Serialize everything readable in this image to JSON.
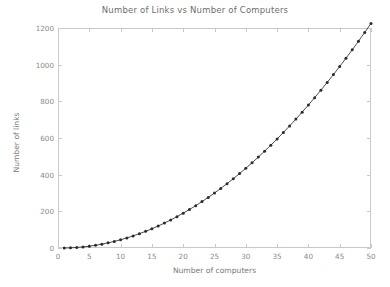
{
  "chart_data": {
    "type": "line",
    "title": "Number of Links vs Number of Computers",
    "xlabel": "Number of computers",
    "ylabel": "Number of links",
    "xlim": [
      0,
      50
    ],
    "ylim": [
      0,
      1200
    ],
    "xticks": [
      0,
      5,
      10,
      15,
      20,
      25,
      30,
      35,
      40,
      45,
      50
    ],
    "yticks": [
      0,
      200,
      400,
      600,
      800,
      1000,
      1200
    ],
    "grid": false,
    "legend": null,
    "marker": "filled-circle",
    "line_color": "#3a3a3a",
    "marker_color": "#2b2b2b",
    "frame_color": "#c9c9c9",
    "text_color": "#8a8a8a",
    "background": "#ffffff",
    "series": [
      {
        "name": "links",
        "x": [
          1,
          2,
          3,
          4,
          5,
          6,
          7,
          8,
          9,
          10,
          11,
          12,
          13,
          14,
          15,
          16,
          17,
          18,
          19,
          20,
          21,
          22,
          23,
          24,
          25,
          26,
          27,
          28,
          29,
          30,
          31,
          32,
          33,
          34,
          35,
          36,
          37,
          38,
          39,
          40,
          41,
          42,
          43,
          44,
          45,
          46,
          47,
          48,
          49,
          50
        ],
        "values": [
          0,
          1,
          3,
          6,
          10,
          15,
          21,
          28,
          36,
          45,
          55,
          66,
          78,
          91,
          105,
          120,
          136,
          153,
          171,
          190,
          210,
          231,
          253,
          276,
          300,
          325,
          351,
          378,
          406,
          435,
          465,
          496,
          528,
          561,
          595,
          630,
          666,
          703,
          741,
          780,
          820,
          861,
          903,
          946,
          990,
          1035,
          1081,
          1128,
          1176,
          1225
        ]
      }
    ]
  }
}
